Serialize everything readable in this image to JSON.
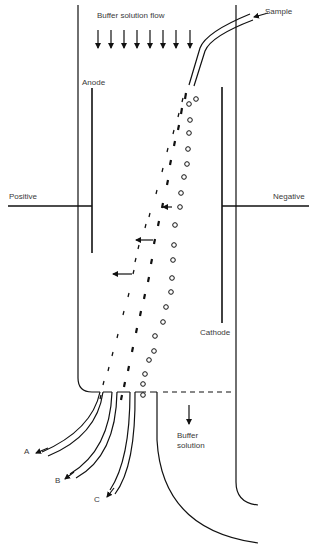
{
  "diagram": {
    "labels": {
      "buffer_flow": "Buffer solution flow",
      "sample": "Sample",
      "anode": "Anode",
      "cathode": "Cathode",
      "positive": "Positive",
      "negative": "Negative",
      "buffer_out_1": "Buffer",
      "buffer_out_2": "solution",
      "outlet_a": "A",
      "outlet_b": "B",
      "outlet_c": "C"
    },
    "colors": {
      "stroke": "#111111",
      "text": "#3a3a3a",
      "background": "#ffffff"
    },
    "buffer_arrow_count": 8,
    "particle_streams": [
      {
        "name": "stream-A",
        "marker": "thin-dash",
        "deflection": "most toward anode"
      },
      {
        "name": "stream-B",
        "marker": "thick-dash",
        "deflection": "intermediate"
      },
      {
        "name": "stream-C",
        "marker": "circle",
        "deflection": "least"
      }
    ]
  }
}
